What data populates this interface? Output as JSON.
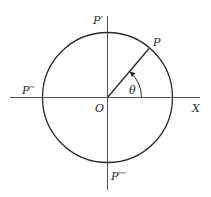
{
  "diagram": {
    "title": "",
    "type": "unit-circle-angle",
    "colors": {
      "stroke": "#2a2a2a",
      "axis": "#555555",
      "background": "#ffffff"
    },
    "labels": {
      "p_top": "P′",
      "p_left": "P′′",
      "p_bottom": "P′′′",
      "p": "P",
      "origin": "O",
      "x_axis": "X",
      "angle": "θ"
    }
  }
}
